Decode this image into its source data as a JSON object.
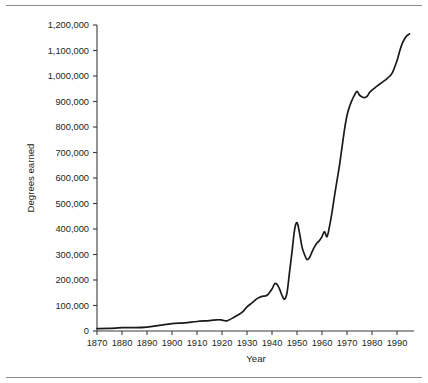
{
  "figure": {
    "background_color": "#ffffff",
    "rule_color": "#8a8a8a",
    "line_color": "#1a1a1a",
    "text_color": "#231f20"
  },
  "chart_data": {
    "type": "line",
    "title": "",
    "subtitle": "",
    "xlabel": "Year",
    "ylabel": "Degrees earned",
    "xlim": [
      1868,
      1996
    ],
    "ylim": [
      0,
      1200000
    ],
    "grid": false,
    "legend": null,
    "annotations": [],
    "x_ticks": [
      1870,
      1880,
      1890,
      1900,
      1910,
      1920,
      1930,
      1940,
      1950,
      1960,
      1970,
      1980,
      1990
    ],
    "x_tick_labels": [
      "1870",
      "1880",
      "1890",
      "1900",
      "1910",
      "1920",
      "1930",
      "1940",
      "1950",
      "1960",
      "1970",
      "1980",
      "1990"
    ],
    "y_ticks": [
      0,
      100000,
      200000,
      300000,
      400000,
      500000,
      600000,
      700000,
      800000,
      900000,
      1000000,
      1100000,
      1200000
    ],
    "y_tick_labels": [
      "0",
      "100,000",
      "200,000",
      "300,000",
      "400,000",
      "500,000",
      "600,000",
      "700,000",
      "800,000",
      "900,000",
      "1,000,000",
      "1,100,000",
      "1,200,000"
    ],
    "series": [
      {
        "name": "Degrees earned",
        "color": "#1a1a1a",
        "x": [
          1870,
          1875,
          1880,
          1885,
          1890,
          1895,
          1900,
          1905,
          1910,
          1915,
          1918,
          1920,
          1922,
          1925,
          1928,
          1930,
          1932,
          1934,
          1936,
          1938,
          1940,
          1941,
          1942,
          1943,
          1944,
          1945,
          1946,
          1947,
          1948,
          1949,
          1950,
          1951,
          1952,
          1953,
          1954,
          1955,
          1956,
          1957,
          1958,
          1959,
          1960,
          1961,
          1962,
          1963,
          1964,
          1965,
          1966,
          1967,
          1968,
          1969,
          1970,
          1971,
          1972,
          1973,
          1974,
          1975,
          1976,
          1977,
          1978,
          1979,
          1980,
          1982,
          1984,
          1986,
          1988,
          1990,
          1991,
          1992,
          1993,
          1994,
          1995
        ],
        "y": [
          9400,
          10500,
          12900,
          13000,
          15500,
          22000,
          29000,
          32000,
          37200,
          41000,
          44000,
          43000,
          40000,
          55000,
          73000,
          95000,
          110000,
          127000,
          136000,
          140000,
          165000,
          185000,
          183000,
          165000,
          140000,
          125000,
          150000,
          230000,
          310000,
          395000,
          425000,
          385000,
          330000,
          300000,
          280000,
          288000,
          310000,
          330000,
          345000,
          355000,
          370000,
          390000,
          370000,
          410000,
          465000,
          530000,
          590000,
          650000,
          720000,
          790000,
          845000,
          880000,
          905000,
          925000,
          940000,
          925000,
          918000,
          915000,
          920000,
          935000,
          945000,
          960000,
          975000,
          990000,
          1010000,
          1060000,
          1095000,
          1125000,
          1145000,
          1158000,
          1165000
        ]
      }
    ]
  }
}
